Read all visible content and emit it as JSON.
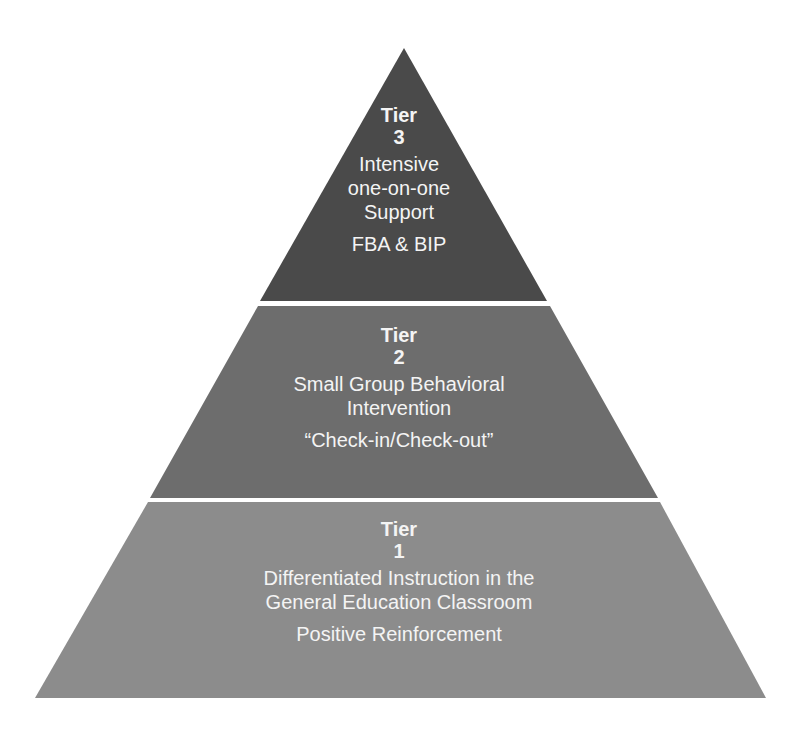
{
  "diagram": {
    "type": "pyramid",
    "colors": {
      "background": "#ffffff",
      "tier3_fill": "#4a4a4a",
      "tier2_fill": "#6d6d6d",
      "tier1_fill": "#8c8c8c",
      "text": "#f4f4f4"
    },
    "tiers": [
      {
        "title": "Tier",
        "number": "3",
        "description": "Intensive\none-on-one\nSupport",
        "example": "FBA & BIP"
      },
      {
        "title": "Tier",
        "number": "2",
        "description": "Small Group Behavioral\nIntervention",
        "example": "“Check-in/Check-out”"
      },
      {
        "title": "Tier",
        "number": "1",
        "description": "Differentiated Instruction in the\nGeneral Education Classroom",
        "example": "Positive Reinforcement"
      }
    ]
  }
}
